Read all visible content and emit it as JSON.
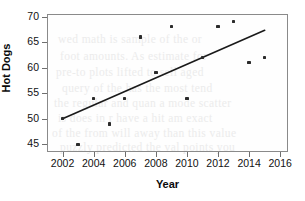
{
  "chart_data": {
    "type": "scatter",
    "title": "",
    "xlabel": "Year",
    "ylabel": "Hot Dogs",
    "xlim": [
      2001.0,
      2016.5
    ],
    "ylim": [
      43.5,
      70.5
    ],
    "xticks": [
      2002,
      2004,
      2006,
      2008,
      2010,
      2012,
      2014,
      2016
    ],
    "yticks": [
      45,
      50,
      55,
      60,
      65,
      70
    ],
    "grid": false,
    "legend": null,
    "x": [
      2002,
      2003,
      2004,
      2005,
      2006,
      2007,
      2008,
      2009,
      2010,
      2011,
      2012,
      2013,
      2014,
      2015
    ],
    "y": [
      50,
      45,
      54,
      49,
      54,
      66,
      59,
      68,
      54,
      62,
      68,
      69,
      61,
      62
    ],
    "points": [
      {
        "x": 2002,
        "y": 50
      },
      {
        "x": 2003,
        "y": 45
      },
      {
        "x": 2004,
        "y": 54
      },
      {
        "x": 2005,
        "y": 49
      },
      {
        "x": 2006,
        "y": 54
      },
      {
        "x": 2007,
        "y": 66
      },
      {
        "x": 2008,
        "y": 59
      },
      {
        "x": 2009,
        "y": 68
      },
      {
        "x": 2010,
        "y": 54
      },
      {
        "x": 2011,
        "y": 62
      },
      {
        "x": 2012,
        "y": 68
      },
      {
        "x": 2013,
        "y": 69
      },
      {
        "x": 2014,
        "y": 61
      },
      {
        "x": 2015,
        "y": 62
      }
    ],
    "trendline": {
      "type": "line",
      "x": [
        2002,
        2015
      ],
      "y": [
        50.0,
        67.3
      ]
    },
    "colors": {
      "point": "#2b2b2b",
      "trendline": "#1a1a1a",
      "axis": "#8a8a8a",
      "text": "#111111",
      "background": "#ffffff"
    }
  },
  "background_bleed": {
    "note": "faint show-through text from the reverse side of the printed page",
    "lines": [
      "wed  math  is  sample  of  the  or",
      "foot  amounts.  As  estimate  for",
      "pre-to  plots  lifted  to  sell  aged",
      "query  of  the  has  the  most  tend",
      "the  regular  and  quan  a  mode  scatter",
      "is  does  in  r  have  a  hit  am  exact",
      "of  the  from  will  away  than  this  value",
      "puzzly  predicted  the  val  points  you"
    ]
  }
}
